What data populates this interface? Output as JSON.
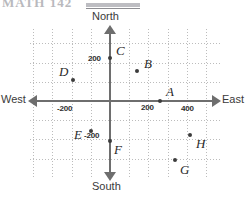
{
  "header": {
    "faint_text": "MATH  142",
    "has_rule": true
  },
  "figure": {
    "type": "coordinate-grid-diagram",
    "compass": {
      "north": "North",
      "south": "South",
      "west": "West",
      "east": "East"
    },
    "axis_ticks": {
      "y_positive": "200",
      "y_negative": "-200",
      "x_positive_1": "200",
      "x_positive_2": "400",
      "x_negative": "-200"
    },
    "colors": {
      "axis": "#6e6e6e",
      "grid": "#bcbcbc",
      "point": "#3c3c3c",
      "text": "#2a2a2a",
      "background": "#ffffff"
    }
  },
  "chart_data": {
    "type": "scatter",
    "title": "",
    "xlabel": "East",
    "ylabel": "North",
    "xlim": [
      -400,
      540
    ],
    "ylim": [
      -380,
      360
    ],
    "grid": true,
    "grid_spacing": 100,
    "legend": "none",
    "xticks": [
      -200,
      200,
      400
    ],
    "yticks": [
      -200,
      200
    ],
    "xticklabels": [
      "-200",
      "200",
      "400"
    ],
    "yticklabels": [
      "-200",
      "200"
    ],
    "axis_arrows": [
      "North",
      "South",
      "East",
      "West"
    ],
    "points": [
      {
        "label": "A",
        "x": 200,
        "y": 0,
        "px": 160,
        "py": 101,
        "lx": 166,
        "ly": 84
      },
      {
        "label": "B",
        "x": 250,
        "y": 150,
        "px": 137,
        "py": 71,
        "lx": 144,
        "ly": 56
      },
      {
        "label": "C",
        "x": 0,
        "y": 200,
        "px": 110,
        "py": 58,
        "lx": 116,
        "ly": 43
      },
      {
        "label": "D",
        "x": -150,
        "y": 100,
        "px": 73,
        "py": 80,
        "lx": 59,
        "ly": 64
      },
      {
        "label": "E",
        "x": -120,
        "y": -150,
        "px": 91,
        "py": 131,
        "lx": 74,
        "ly": 127
      },
      {
        "label": "F",
        "x": 0,
        "y": -200,
        "px": 110,
        "py": 141,
        "lx": 114,
        "ly": 142
      },
      {
        "label": "G",
        "x": 320,
        "y": -300,
        "px": 175,
        "py": 160,
        "lx": 180,
        "ly": 162
      },
      {
        "label": "H",
        "x": 400,
        "y": -200,
        "px": 190,
        "py": 135,
        "lx": 196,
        "ly": 136
      }
    ]
  }
}
